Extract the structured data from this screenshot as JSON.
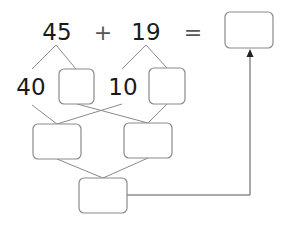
{
  "diagram": {
    "type": "partition-addition",
    "equation": {
      "operand1": "45",
      "operator": "+",
      "operand2": "19",
      "equals": "=",
      "answer": ""
    },
    "partitions": {
      "operand1_tens": "40",
      "operand1_ones": "",
      "operand2_tens": "10",
      "operand2_ones": ""
    },
    "sums": {
      "tens_sum": "",
      "ones_sum": "",
      "total": ""
    },
    "icons": {
      "arrow": "arrow-up-icon"
    }
  }
}
